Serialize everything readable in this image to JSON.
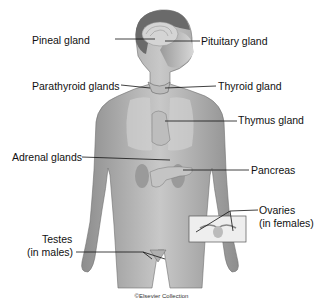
{
  "diagram": {
    "labels": [
      {
        "id": "pineal",
        "text": "Pineal gland",
        "x": 55,
        "y": 34,
        "side": "left"
      },
      {
        "id": "pituitary",
        "text": "Pituitary gland",
        "x": 201,
        "y": 35,
        "side": "right"
      },
      {
        "id": "parathyroid",
        "text": "Parathyroid glands",
        "x": 32,
        "y": 80,
        "side": "left"
      },
      {
        "id": "thyroid",
        "text": "Thyroid gland",
        "x": 218,
        "y": 80,
        "side": "right"
      },
      {
        "id": "thymus",
        "text": "Thymus gland",
        "x": 238,
        "y": 114,
        "side": "right"
      },
      {
        "id": "adrenal",
        "text": "Adrenal glands",
        "x": 12,
        "y": 151,
        "side": "left"
      },
      {
        "id": "pancreas",
        "text": "Pancreas",
        "x": 251,
        "y": 164,
        "side": "right"
      },
      {
        "id": "ovaries1",
        "text": "Ovaries",
        "x": 259,
        "y": 204,
        "side": "right"
      },
      {
        "id": "ovaries2",
        "text": "(in females)",
        "x": 259,
        "y": 217,
        "side": "right"
      },
      {
        "id": "testes1",
        "text": "Testes",
        "x": 42,
        "y": 233,
        "side": "left"
      },
      {
        "id": "testes2",
        "text": "(in males)",
        "x": 27,
        "y": 246,
        "side": "left"
      }
    ],
    "copyright": "©Elsevier Collection"
  }
}
